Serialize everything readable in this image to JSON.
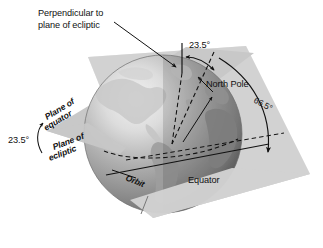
{
  "figure": {
    "type": "astronomy-diagram",
    "background_color": "#ffffff"
  },
  "labels": {
    "perpendicular_line1": "Perpendicular to",
    "perpendicular_line2": "plane of ecliptic",
    "tilt_top": "23.5°",
    "tilt_left": "23.5°",
    "complement": "66.5°",
    "north_pole": "North Pole",
    "equator": "Equator",
    "orbit": "Orbit",
    "plane_of_equator_line1": "Plane of",
    "plane_of_equator_line2": "equator",
    "plane_of_ecliptic_line1": "Plane of",
    "plane_of_ecliptic_line2": "ecliptic"
  },
  "colors": {
    "ecliptic_plane": "#d2d2d2",
    "equator_plane": "#c4c4c4",
    "globe_light": "#e8e8e8",
    "globe_mid": "#9a9a9a",
    "globe_dark": "#5a5a5a",
    "land": "#b4b4b4",
    "line": "#111111",
    "text": "#111111"
  },
  "values": {
    "axial_tilt_degrees": 23.5,
    "complement_degrees": 66.5
  }
}
